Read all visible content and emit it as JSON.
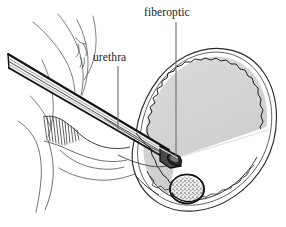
{
  "figure": {
    "width": 286,
    "height": 227,
    "background_color": "#ffffff"
  },
  "labels": {
    "fiberoptic": "fiberoptic",
    "urethra": "urethra"
  },
  "leader_lines": [
    {
      "name": "fiberoptic-leader",
      "x": 176,
      "y1": 22,
      "y2": 157,
      "color": "#6e6e6e"
    },
    {
      "name": "urethra-leader",
      "x": 118,
      "y1": 66,
      "y2": 131,
      "color": "#6e6e6e"
    }
  ],
  "colors": {
    "ink": "#1a1a1a",
    "line": "#2b2b2b",
    "thin_line": "#555555",
    "leader": "#6e6e6e",
    "bladder_fill": "#d5d5d5",
    "bladder_fill_dark": "#c9c9c9",
    "light_cone": "#ffffff",
    "scope_body": "#f2f2f2",
    "scope_edge": "#151515",
    "stone_fill": "#e8e8e8",
    "stone_outline": "#1a1a1a",
    "background": "#ffffff"
  },
  "structures": [
    {
      "name": "bladder",
      "description": "Large oval bladder at right with double outline wall and jagged inner mucosal edge, gray lumen fill"
    },
    {
      "name": "fiberoptic-scope",
      "description": "Long straight multi-line shaft entering from upper left, beveled dark tip inside bladder"
    },
    {
      "name": "urethra",
      "description": "Channel from scope through prostatic tissue into bladder neck"
    },
    {
      "name": "light-cone",
      "description": "White fan of light projected from scope tip toward bladder floor"
    },
    {
      "name": "bladder-stone",
      "description": "Round stippled stone resting on bladder floor, illuminated by light cone"
    },
    {
      "name": "body-contours",
      "description": "Thin curved anatomical contour lines of pelvic tissue at upper left"
    },
    {
      "name": "hatched-tissue",
      "description": "Fine hatch shading marking prostatic/urethral tissue around the scope"
    }
  ]
}
